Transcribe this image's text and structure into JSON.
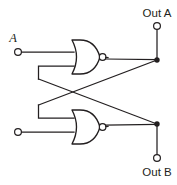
{
  "diagram": {
    "background_color": "#ffffff",
    "line_color": "#231f20"
  },
  "labels": {
    "input_a": "A",
    "input_b": "",
    "output_a": "Out A",
    "output_b": "Out B"
  },
  "gates": [
    {
      "id": "nor-gate-top",
      "type": "NOR",
      "x": 72,
      "y": 40,
      "width": 28,
      "height": 34
    },
    {
      "id": "nor-gate-bottom",
      "type": "NOR",
      "x": 72,
      "y": 110,
      "width": 28,
      "height": 34
    }
  ],
  "terminals": [
    {
      "id": "input-a-terminal",
      "x": 18,
      "y": 52,
      "r": 3.4
    },
    {
      "id": "input-b-terminal",
      "x": 18,
      "y": 132,
      "r": 3.4
    },
    {
      "id": "output-a-terminal",
      "x": 157,
      "y": 26,
      "r": 3.4
    },
    {
      "id": "output-b-terminal",
      "x": 157,
      "y": 158,
      "r": 3.4
    }
  ],
  "junctions": [
    {
      "id": "junction-out-a",
      "x": 157,
      "y": 60,
      "r": 2.6
    },
    {
      "id": "junction-out-b",
      "x": 157,
      "y": 124,
      "r": 2.6
    }
  ]
}
